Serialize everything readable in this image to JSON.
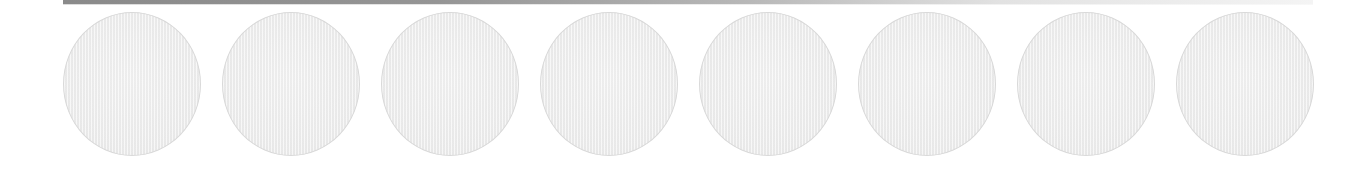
{
  "header": {
    "bar": {
      "color_start": "#8a8a8a",
      "color_end": "#f4f4f4"
    }
  },
  "slots": {
    "count": 8,
    "fill_color": "#efefef",
    "border_color": "#d9d9d9",
    "items": [
      {
        "index": 1,
        "state": "empty"
      },
      {
        "index": 2,
        "state": "empty"
      },
      {
        "index": 3,
        "state": "empty"
      },
      {
        "index": 4,
        "state": "empty"
      },
      {
        "index": 5,
        "state": "empty"
      },
      {
        "index": 6,
        "state": "empty"
      },
      {
        "index": 7,
        "state": "empty"
      },
      {
        "index": 8,
        "state": "empty"
      }
    ]
  }
}
